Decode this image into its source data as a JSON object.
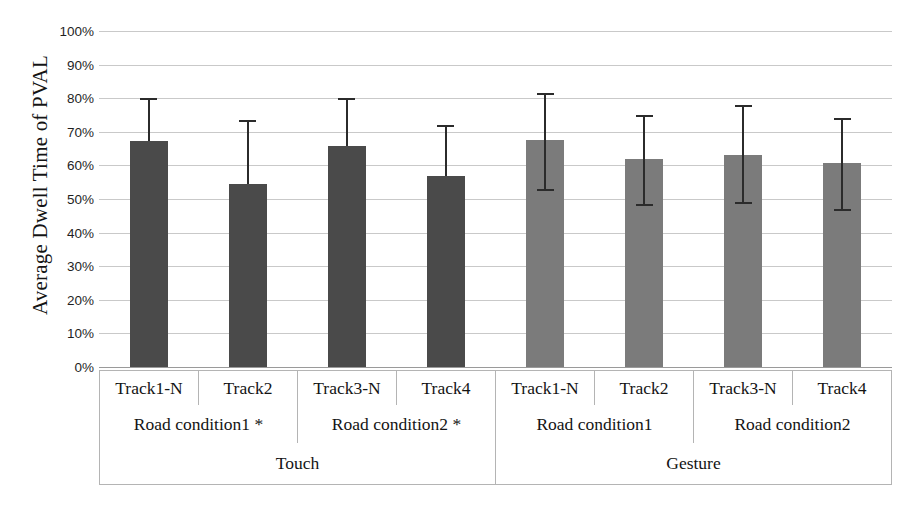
{
  "chart_data": {
    "type": "bar",
    "title": "",
    "subtitle": "",
    "xlabel": "",
    "ylabel": "Average Dwell Time of PVAL",
    "ylim": [
      0,
      100
    ],
    "yunit": "%",
    "grid": true,
    "legend": "none",
    "ytick_labels": [
      "100%",
      "90%",
      "80%",
      "70%",
      "60%",
      "50%",
      "40%",
      "30%",
      "20%",
      "10%",
      "0%"
    ],
    "ytick_values": [
      100,
      90,
      80,
      70,
      60,
      50,
      40,
      30,
      20,
      10,
      0
    ],
    "categories": [
      "Track1-N",
      "Track2",
      "Track3-N",
      "Track4",
      "Track1-N",
      "Track2",
      "Track3-N",
      "Track4"
    ],
    "values": [
      67.3,
      54.5,
      65.8,
      56.8,
      67.7,
      62.0,
      63.2,
      60.6
    ],
    "error_upper": [
      80.0,
      73.5,
      80.0,
      72.0,
      81.5,
      75.0,
      78.0,
      74.0
    ],
    "error_lower": [
      null,
      null,
      null,
      null,
      53.0,
      48.5,
      49.0,
      47.0
    ],
    "bar_colors": [
      "#4a4a4a",
      "#4a4a4a",
      "#4a4a4a",
      "#4a4a4a",
      "#7b7b7b",
      "#7b7b7b",
      "#7b7b7b",
      "#7b7b7b"
    ],
    "errorbar_color": "#2b2b2b",
    "gridline_color": "#c9c9c9",
    "groups_level_road": [
      "Road condition1 *",
      "Road condition2 *",
      "Road condition1",
      "Road condition2"
    ],
    "groups_level_mode": [
      "Touch",
      "Gesture"
    ]
  },
  "axis": {
    "y_title": "Average Dwell Time of PVAL",
    "ticks": [
      {
        "label": "100%",
        "value": 100
      },
      {
        "label": "90%",
        "value": 90
      },
      {
        "label": "80%",
        "value": 80
      },
      {
        "label": "70%",
        "value": 70
      },
      {
        "label": "60%",
        "value": 60
      },
      {
        "label": "50%",
        "value": 50
      },
      {
        "label": "40%",
        "value": 40
      },
      {
        "label": "30%",
        "value": 30
      },
      {
        "label": "20%",
        "value": 20
      },
      {
        "label": "10%",
        "value": 10
      },
      {
        "label": "0%",
        "value": 0
      }
    ]
  },
  "labels": {
    "tracks": [
      "Track1-N",
      "Track2",
      "Track3-N",
      "Track4",
      "Track1-N",
      "Track2",
      "Track3-N",
      "Track4"
    ],
    "roads": [
      "Road condition1 *",
      "Road condition2 *",
      "Road condition1",
      "Road condition2"
    ],
    "modes": [
      "Touch",
      "Gesture"
    ]
  }
}
